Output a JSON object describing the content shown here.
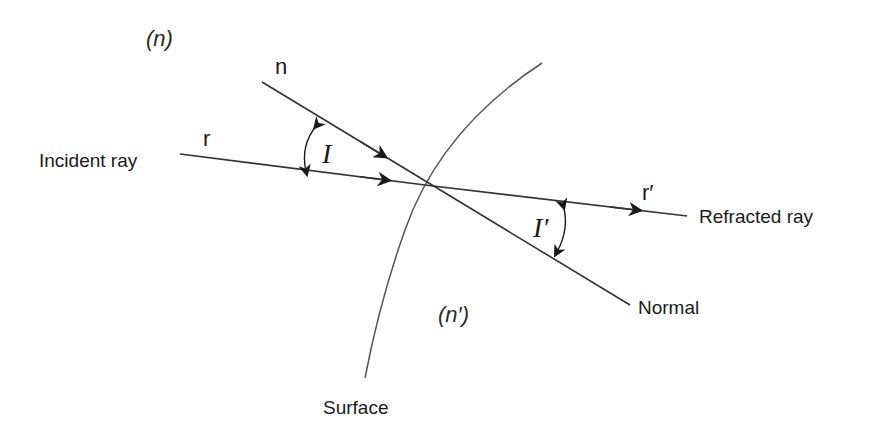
{
  "diagram": {
    "type": "optics-refraction",
    "media": {
      "incident": "(n)",
      "refracted": "(n′)"
    },
    "labels": {
      "incident_ray": "Incident ray",
      "refracted_ray": "Refracted ray",
      "normal": "Normal",
      "surface": "Surface",
      "normal_symbol": "n",
      "incident_symbol": "r",
      "refracted_symbol": "r′",
      "angle_incidence": "I",
      "angle_refraction": "I′"
    },
    "colors": {
      "line": "#333333",
      "medium_text": "#666666",
      "text": "#1a1a1a"
    }
  }
}
